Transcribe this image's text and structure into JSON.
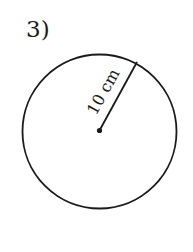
{
  "problem": {
    "number_label": "3)"
  },
  "figure": {
    "shape": "circle",
    "radius_label": "10 cm",
    "stroke_color": "#1a1a1a",
    "background_color": "#ffffff",
    "center": [
      99.5,
      131.5
    ],
    "radius": 77,
    "radius_endpoint": [
      137,
      62
    ]
  }
}
